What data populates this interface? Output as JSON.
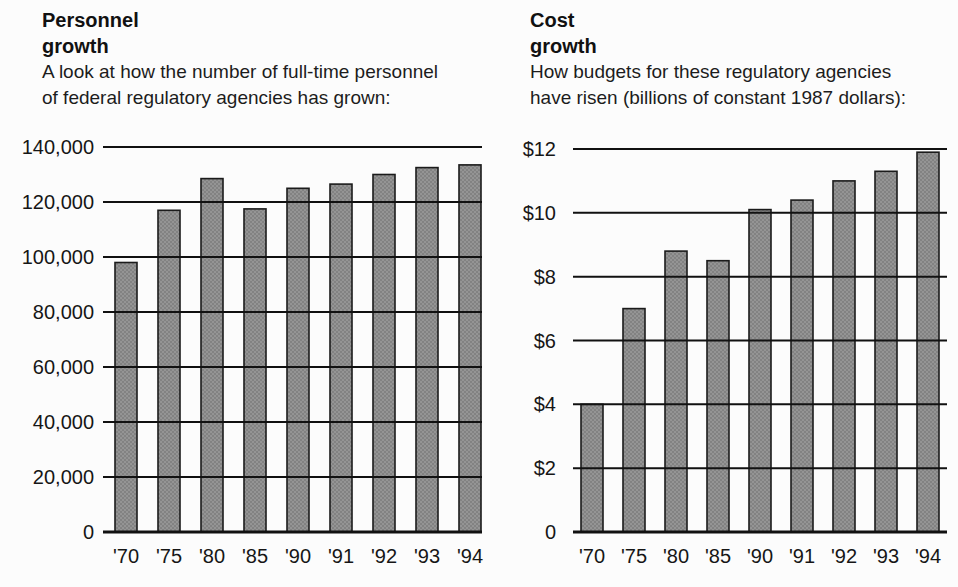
{
  "figure": {
    "background": "#fcfcfc",
    "bar_fill": "#949494",
    "bar_stipple_dot": "#6b6b6b",
    "bar_stroke": "#1b1b1b",
    "gridline_color": "#111111",
    "text_color": "#161616"
  },
  "chart_data": [
    {
      "type": "bar",
      "title": "Personnel growth",
      "title_lines": [
        "Personnel",
        "growth"
      ],
      "subtitle": "A look at how the number of full-time personnel of federal regulatory agencies has grown:",
      "subtitle_lines": [
        "A look at how the number of full-time personnel",
        "of federal regulatory agencies has grown:"
      ],
      "categories": [
        "'70",
        "'75",
        "'80",
        "'85",
        "'90",
        "'91",
        "'92",
        "'93",
        "'94"
      ],
      "values": [
        98000,
        117000,
        128500,
        117500,
        125000,
        126500,
        130000,
        132500,
        133500
      ],
      "xlabel": "",
      "ylabel": "",
      "ylim": [
        0,
        140000
      ],
      "ytick_step": 20000,
      "ytick_labels": [
        "0",
        "20,000",
        "40,000",
        "60,000",
        "80,000",
        "100,000",
        "120,000",
        "140,000"
      ],
      "grid": true,
      "gridlines_over_bars": true,
      "legend": null
    },
    {
      "type": "bar",
      "title": "Cost growth",
      "title_lines": [
        "Cost",
        "growth"
      ],
      "subtitle": "How budgets for these regulatory agencies have risen (billions of constant 1987 dollars):",
      "subtitle_lines": [
        "How budgets for these regulatory agencies",
        "have risen (billions of constant 1987 dollars):"
      ],
      "categories": [
        "'70",
        "'75",
        "'80",
        "'85",
        "'90",
        "'91",
        "'92",
        "'93",
        "'94"
      ],
      "values": [
        4.0,
        7.0,
        8.8,
        8.5,
        10.1,
        10.4,
        11.0,
        11.3,
        11.9
      ],
      "xlabel": "",
      "ylabel": "",
      "ylim": [
        0,
        12
      ],
      "ytick_step": 2,
      "ytick_labels": [
        "0",
        "$2",
        "$4",
        "$6",
        "$8",
        "$10",
        "$12"
      ],
      "grid": true,
      "gridlines_over_bars": true,
      "legend": null
    }
  ]
}
